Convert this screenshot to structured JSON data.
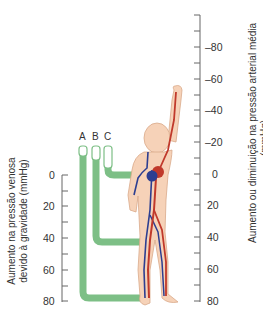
{
  "diagram": {
    "title": "",
    "tubes": [
      {
        "label": "A",
        "level_mmHg": 80
      },
      {
        "label": "B",
        "level_mmHg": 40
      },
      {
        "label": "C",
        "level_mmHg": 0
      }
    ],
    "left_axis": {
      "label_line1": "Aumento na pressão venosa",
      "label_line2": "devido à gravidade (mmHg)",
      "ticks": [
        "0",
        "20",
        "40",
        "60",
        "80"
      ]
    },
    "right_axis": {
      "label_line1": "Aumento ou diminuição na pressão arterial média",
      "label_line2": "(mmHg)",
      "ticks": [
        "–80",
        "–60",
        "–40",
        "–20",
        "0",
        "20",
        "40",
        "60",
        "80"
      ]
    },
    "colors": {
      "tube_fill": "#7dbf86",
      "artery": "#c0392b",
      "vein": "#2c3e91",
      "skin": "#f6d2b8",
      "skin_outline": "#d9a98a",
      "axis": "#555555"
    }
  }
}
